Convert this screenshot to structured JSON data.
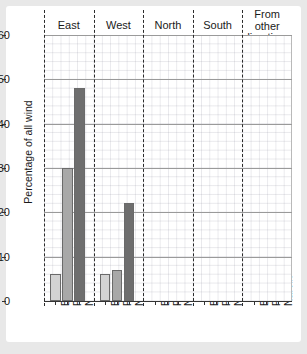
{
  "chart_data": {
    "type": "bar",
    "title": "",
    "xlabel": "",
    "ylabel": "Percentage of all wind",
    "ylim": [
      0,
      60
    ],
    "yticks": [
      0,
      10,
      20,
      30,
      40,
      50,
      60
    ],
    "grid": true,
    "legend_position": "none",
    "group_labels": [
      "East",
      "West",
      "North",
      "South",
      "From other directions"
    ],
    "categories": [
      "Bo",
      "Finnay",
      "Narvik"
    ],
    "series": [
      {
        "name": "East",
        "values": [
          6,
          30,
          48
        ]
      },
      {
        "name": "West",
        "values": [
          6,
          7,
          22
        ]
      },
      {
        "name": "North",
        "values": [
          0,
          0,
          0
        ]
      },
      {
        "name": "South",
        "values": [
          0,
          0,
          0
        ]
      },
      {
        "name": "From other directions",
        "values": [
          0,
          0,
          0
        ]
      }
    ],
    "bar_colors": {
      "Bo": "#d3d3d3",
      "Finnay": "#a8a8a8",
      "Narvik": "#6e6e6e"
    }
  },
  "axis": {
    "y_title": "Percentage of all wind",
    "y_tick_labels": [
      "0",
      "10",
      "20",
      "30",
      "40",
      "50",
      "60"
    ]
  },
  "groups": [
    {
      "label": "East",
      "label_line2": ""
    },
    {
      "label": "West",
      "label_line2": ""
    },
    {
      "label": "North",
      "label_line2": ""
    },
    {
      "label": "South",
      "label_line2": ""
    },
    {
      "label": "From other",
      "label_line2": "directions"
    }
  ],
  "x_tick_labels": [
    "Bo",
    "Finnay",
    "Narvik",
    "Bo",
    "Finnay",
    "Narvik",
    "Bo",
    "Finnay",
    "Narvik",
    "Bo",
    "Finnay",
    "Narvik",
    "Bo",
    "Finnay",
    "Narvik"
  ]
}
